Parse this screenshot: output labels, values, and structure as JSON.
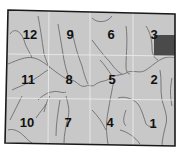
{
  "map": {
    "colors": {
      "land": "#c8c8c8",
      "border": "#1a1a1a",
      "grid": "#eeeeee",
      "river": "#6e6e6e",
      "highlight": "#4a4a4a",
      "label": "#111111"
    },
    "sections": [
      {
        "id": "12",
        "label": "12"
      },
      {
        "id": "9",
        "label": "9"
      },
      {
        "id": "6",
        "label": "6"
      },
      {
        "id": "3",
        "label": "3",
        "highlighted": true
      },
      {
        "id": "11",
        "label": "11"
      },
      {
        "id": "8",
        "label": "8"
      },
      {
        "id": "5",
        "label": "5"
      },
      {
        "id": "2",
        "label": "2"
      },
      {
        "id": "10",
        "label": "10"
      },
      {
        "id": "7",
        "label": "7"
      },
      {
        "id": "4",
        "label": "4"
      },
      {
        "id": "1",
        "label": "1"
      }
    ]
  }
}
